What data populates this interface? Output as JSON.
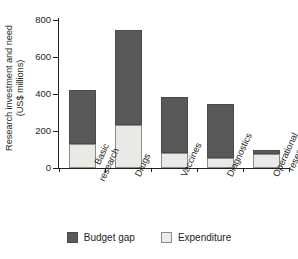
{
  "chart_data": {
    "type": "bar",
    "subtype": "stacked-vertical",
    "title": "",
    "xlabel": "",
    "ylabel": "Research investment and need (US$ millions)",
    "ylabel_line1": "Research investment and need",
    "ylabel_line2": "(US$ millions)",
    "categories": [
      "Basic research",
      "Drugs",
      "Vaccines",
      "Diagnostics",
      "Operational research"
    ],
    "category_lines": [
      [
        "Basic",
        "research"
      ],
      [
        "Drugs"
      ],
      [
        "Vaccines"
      ],
      [
        "Diagnostics"
      ],
      [
        "Operational",
        "research"
      ]
    ],
    "series": [
      {
        "name": "Expenditure",
        "color": "#ececea",
        "values": [
          130,
          230,
          80,
          55,
          75
        ]
      },
      {
        "name": "Budget gap",
        "color": "#595959",
        "values": [
          290,
          515,
          305,
          290,
          20
        ]
      }
    ],
    "totals": [
      420,
      745,
      385,
      345,
      95
    ],
    "ylim": [
      0,
      800
    ],
    "yticks": [
      0,
      200,
      400,
      600,
      800
    ],
    "ytick_labels": [
      "0",
      "200",
      "400",
      "600",
      "800"
    ],
    "grid": false,
    "legend_position": "bottom-center",
    "legend": [
      {
        "label": "Budget gap",
        "color": "#595959"
      },
      {
        "label": "Expenditure",
        "color": "#ececea"
      }
    ],
    "axis_color": "#231f20",
    "background": "#ffffff"
  }
}
